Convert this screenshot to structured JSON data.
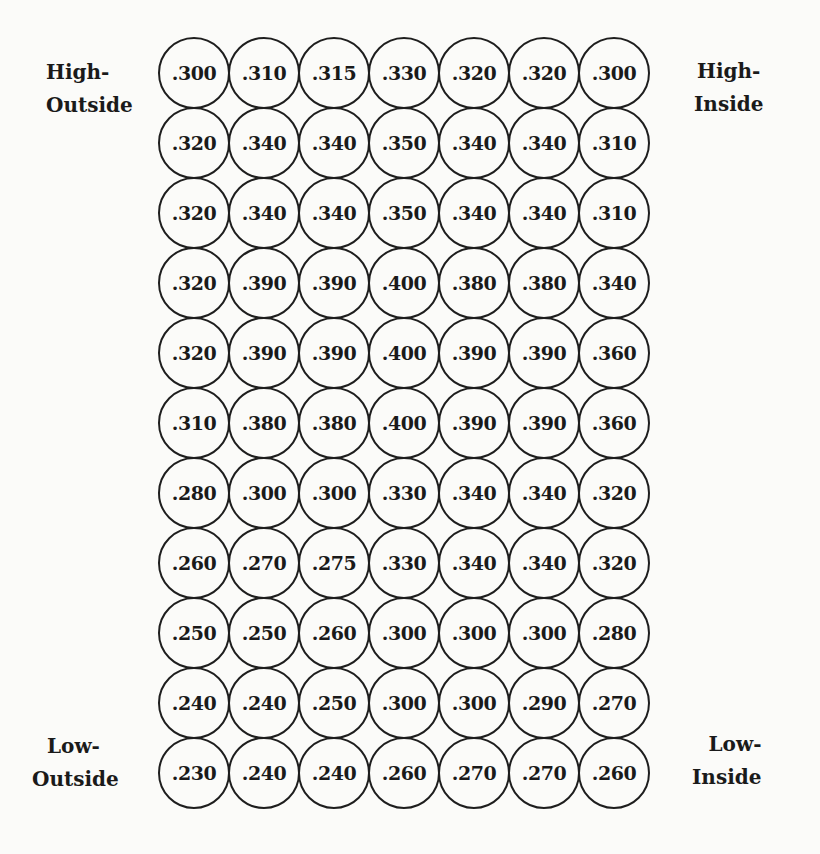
{
  "labels": {
    "high_outside": [
      "High-",
      "Outside"
    ],
    "high_inside": [
      "High-",
      "Inside"
    ],
    "low_outside": [
      "Low-",
      "Outside"
    ],
    "low_inside": [
      "Low-",
      "Inside"
    ]
  },
  "zone_grid": {
    "rows": [
      [
        ".300",
        ".310",
        ".315",
        ".330",
        ".320",
        ".320",
        ".300"
      ],
      [
        ".320",
        ".340",
        ".340",
        ".350",
        ".340",
        ".340",
        ".310"
      ],
      [
        ".320",
        ".340",
        ".340",
        ".350",
        ".340",
        ".340",
        ".310"
      ],
      [
        ".320",
        ".390",
        ".390",
        ".400",
        ".380",
        ".380",
        ".340"
      ],
      [
        ".320",
        ".390",
        ".390",
        ".400",
        ".390",
        ".390",
        ".360"
      ],
      [
        ".310",
        ".380",
        ".380",
        ".400",
        ".390",
        ".390",
        ".360"
      ],
      [
        ".280",
        ".300",
        ".300",
        ".330",
        ".340",
        ".340",
        ".320"
      ],
      [
        ".260",
        ".270",
        ".275",
        ".330",
        ".340",
        ".340",
        ".320"
      ],
      [
        ".250",
        ".250",
        ".260",
        ".300",
        ".300",
        ".300",
        ".280"
      ],
      [
        ".240",
        ".240",
        ".250",
        ".300",
        ".300",
        ".290",
        ".270"
      ],
      [
        ".230",
        ".240",
        ".240",
        ".260",
        ".270",
        ".270",
        ".260"
      ]
    ]
  },
  "chart_data": {
    "type": "heatmap",
    "title": "",
    "rows_top_to_bottom": 11,
    "cols_outside_to_inside": 7,
    "corner_labels": {
      "top_left": "High-Outside",
      "top_right": "High-Inside",
      "bottom_left": "Low-Outside",
      "bottom_right": "Low-Inside"
    },
    "values": [
      [
        0.3,
        0.31,
        0.315,
        0.33,
        0.32,
        0.32,
        0.3
      ],
      [
        0.32,
        0.34,
        0.34,
        0.35,
        0.34,
        0.34,
        0.31
      ],
      [
        0.32,
        0.34,
        0.34,
        0.35,
        0.34,
        0.34,
        0.31
      ],
      [
        0.32,
        0.39,
        0.39,
        0.4,
        0.38,
        0.38,
        0.34
      ],
      [
        0.32,
        0.39,
        0.39,
        0.4,
        0.39,
        0.39,
        0.36
      ],
      [
        0.31,
        0.38,
        0.38,
        0.4,
        0.39,
        0.39,
        0.36
      ],
      [
        0.28,
        0.3,
        0.3,
        0.33,
        0.34,
        0.34,
        0.32
      ],
      [
        0.26,
        0.27,
        0.275,
        0.33,
        0.34,
        0.34,
        0.32
      ],
      [
        0.25,
        0.25,
        0.26,
        0.3,
        0.3,
        0.3,
        0.28
      ],
      [
        0.24,
        0.24,
        0.25,
        0.3,
        0.3,
        0.29,
        0.27
      ],
      [
        0.23,
        0.24,
        0.24,
        0.26,
        0.27,
        0.27,
        0.26
      ]
    ]
  }
}
